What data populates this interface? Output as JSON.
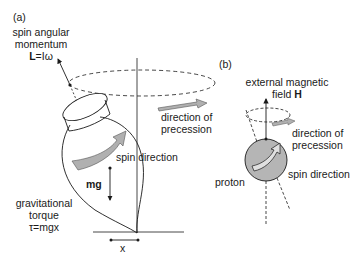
{
  "panel_a": {
    "label": "(a)",
    "spin_angular_momentum_line1": "spin angular",
    "spin_angular_momentum_line2": "momentum",
    "L_symbol": "L",
    "L_formula": "=Iω",
    "direction_of_precession_line1": "direction of",
    "direction_of_precession_line2": "precession",
    "spin_direction": "spin direction",
    "mg": "mg",
    "gravitational_torque_line1": "gravitational",
    "gravitational_torque_line2": "torque",
    "torque_formula": "τ=mgx",
    "x_label": "x"
  },
  "panel_b": {
    "label": "(b)",
    "external_field_line1": "external magnetic",
    "external_field_line2_prefix": "field ",
    "H_symbol": "H",
    "direction_of_precession_line1": "direction of",
    "direction_of_precession_line2": "precession",
    "proton": "proton",
    "spin_direction": "spin direction"
  },
  "colors": {
    "line": "#1a1a1a",
    "arrow_fill": "#b0b0b0",
    "proton_fill": "#b5b5b5"
  }
}
